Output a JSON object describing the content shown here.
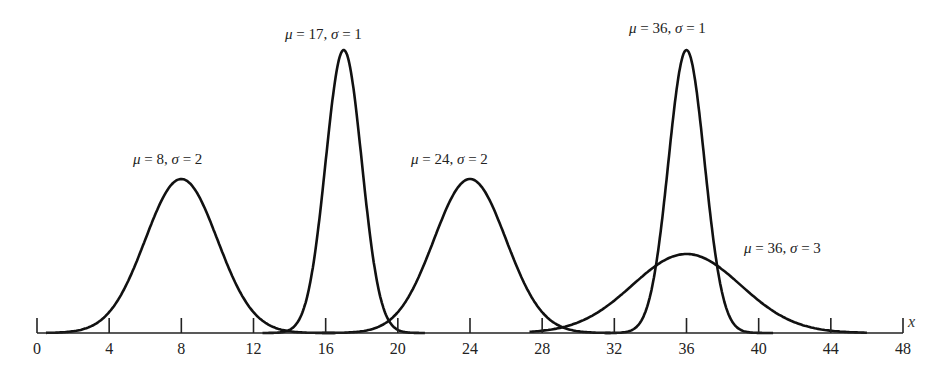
{
  "chart_data": {
    "type": "line",
    "title": "",
    "xlabel": "x",
    "ylabel": "",
    "xlim": [
      0,
      48
    ],
    "grid": false,
    "legend": "inline labels above curves",
    "x_ticks": [
      0,
      4,
      8,
      12,
      16,
      20,
      24,
      28,
      32,
      36,
      40,
      44,
      48
    ],
    "series": [
      {
        "name": "μ = 8, σ = 2",
        "mu": 8,
        "sigma": 2,
        "peak_px_height": 154,
        "range": [
          0.5,
          16.5
        ]
      },
      {
        "name": "μ = 17, σ = 1",
        "mu": 17,
        "sigma": 1,
        "peak_px_height": 283,
        "range": [
          12.5,
          21.5
        ]
      },
      {
        "name": "μ = 24, σ = 2",
        "mu": 24,
        "sigma": 2,
        "peak_px_height": 154,
        "range": [
          15.8,
          31.8
        ]
      },
      {
        "name": "μ = 36, σ = 1",
        "mu": 36,
        "sigma": 1,
        "peak_px_height": 283,
        "range": [
          31.5,
          40.8
        ]
      },
      {
        "name": "μ = 36, σ = 3",
        "mu": 36,
        "sigma": 3,
        "peak_px_height": 79,
        "range": [
          27.3,
          46
        ]
      }
    ]
  },
  "labels": [
    {
      "text": "μ = 8, σ = 2",
      "x": 133,
      "y": 151
    },
    {
      "text": "μ = 17, σ = 1",
      "x": 285,
      "y": 26
    },
    {
      "text": "μ = 24, σ = 2",
      "x": 411,
      "y": 151
    },
    {
      "text": "μ = 36, σ = 1",
      "x": 629,
      "y": 20
    },
    {
      "text": "μ = 36, σ = 3",
      "x": 744,
      "y": 240
    }
  ],
  "axis": {
    "name": "x",
    "ticks": [
      "0",
      "4",
      "8",
      "12",
      "16",
      "20",
      "24",
      "28",
      "32",
      "36",
      "40",
      "44",
      "48"
    ]
  }
}
